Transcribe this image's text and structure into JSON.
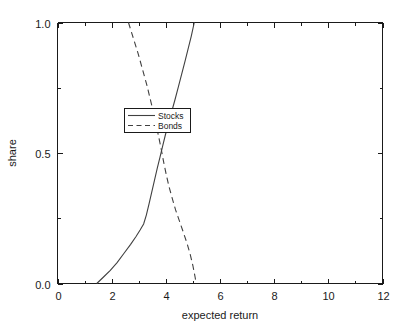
{
  "chart_data": {
    "type": "line",
    "title": "",
    "subtitle": "",
    "xlabel": "expected return",
    "ylabel": "share",
    "xlim": [
      0,
      12
    ],
    "ylim": [
      0,
      1
    ],
    "grid": false,
    "legend_position": "center",
    "xticks": [
      "0",
      "2",
      "4",
      "6",
      "8",
      "10",
      "12"
    ],
    "xtick_values": [
      0,
      2,
      4,
      6,
      8,
      10,
      12
    ],
    "xminor_ticks": [
      1,
      3,
      5,
      7,
      9,
      11
    ],
    "yticks": [
      "0.0",
      "0.5",
      "1.0"
    ],
    "ytick_values": [
      0,
      0.5,
      1
    ],
    "yminor_ticks": [
      0.25,
      0.75
    ],
    "series": [
      {
        "name": "Stocks",
        "style": "solid",
        "color": "#404040",
        "points": [
          [
            1.45,
            0.0
          ],
          [
            1.7,
            0.025
          ],
          [
            1.95,
            0.05
          ],
          [
            2.2,
            0.08
          ],
          [
            2.45,
            0.115
          ],
          [
            2.7,
            0.15
          ],
          [
            2.9,
            0.18
          ],
          [
            3.05,
            0.205
          ],
          [
            3.18,
            0.228
          ],
          [
            3.28,
            0.262
          ],
          [
            3.38,
            0.305
          ],
          [
            3.48,
            0.35
          ],
          [
            3.58,
            0.395
          ],
          [
            3.68,
            0.44
          ],
          [
            3.78,
            0.482
          ],
          [
            3.88,
            0.525
          ],
          [
            3.98,
            0.568
          ],
          [
            4.1,
            0.615
          ],
          [
            4.22,
            0.66
          ],
          [
            4.34,
            0.705
          ],
          [
            4.46,
            0.752
          ],
          [
            4.58,
            0.8
          ],
          [
            4.7,
            0.848
          ],
          [
            4.82,
            0.898
          ],
          [
            4.94,
            0.948
          ],
          [
            5.05,
            1.0
          ]
        ]
      },
      {
        "name": "Bonds",
        "style": "dashed",
        "color": "#404040",
        "points": [
          [
            2.62,
            1.0
          ],
          [
            2.8,
            0.94
          ],
          [
            2.98,
            0.88
          ],
          [
            3.14,
            0.82
          ],
          [
            3.3,
            0.76
          ],
          [
            3.44,
            0.7
          ],
          [
            3.58,
            0.64
          ],
          [
            3.7,
            0.58
          ],
          [
            3.82,
            0.52
          ],
          [
            3.92,
            0.465
          ],
          [
            4.02,
            0.415
          ],
          [
            4.12,
            0.37
          ],
          [
            4.24,
            0.325
          ],
          [
            4.36,
            0.282
          ],
          [
            4.5,
            0.24
          ],
          [
            4.64,
            0.198
          ],
          [
            4.78,
            0.155
          ],
          [
            4.9,
            0.112
          ],
          [
            5.0,
            0.068
          ],
          [
            5.08,
            0.025
          ],
          [
            5.12,
            0.0
          ]
        ]
      }
    ],
    "legend": [
      {
        "label": "Stocks",
        "style": "solid"
      },
      {
        "label": "Bonds",
        "style": "dashed"
      }
    ]
  }
}
